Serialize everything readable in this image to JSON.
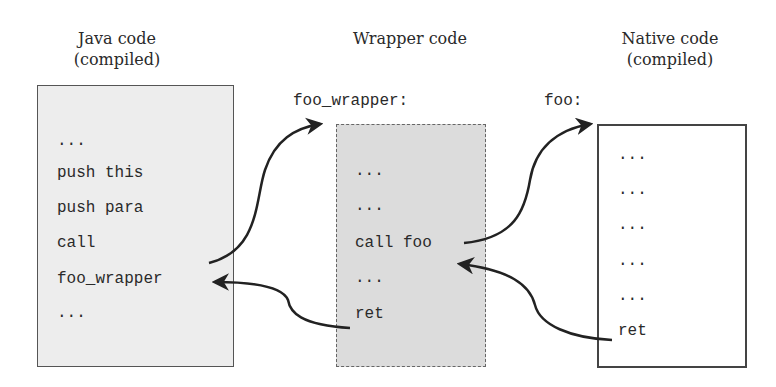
{
  "columns": [
    {
      "id": "java",
      "title_line1": "Java code",
      "title_line2": "(compiled)",
      "entry_label": "",
      "lines": [
        "...",
        "push this",
        "push para",
        "call",
        "foo_wrapper",
        "..."
      ]
    },
    {
      "id": "wrapper",
      "title_line1": "Wrapper code",
      "title_line2": "",
      "entry_label": "foo_wrapper:",
      "lines": [
        "...",
        "...",
        "call foo",
        "...",
        "ret"
      ]
    },
    {
      "id": "native",
      "title_line1": "Native code",
      "title_line2": "(compiled)",
      "entry_label": "foo:",
      "lines": [
        "...",
        "...",
        "...",
        "...",
        "...",
        "ret"
      ]
    }
  ],
  "arrows": [
    {
      "from": "java: call foo_wrapper",
      "to": "wrapper: foo_wrapper:"
    },
    {
      "from": "wrapper: ret",
      "to": "java: foo_wrapper (return)"
    },
    {
      "from": "wrapper: call foo",
      "to": "native: foo:"
    },
    {
      "from": "native: ret",
      "to": "wrapper: after call foo (return)"
    }
  ],
  "colors": {
    "java_box_fill": "#ededed",
    "wrapper_box_fill": "#dcdcdc",
    "native_box_fill": "#ffffff",
    "stroke": "#222222"
  }
}
